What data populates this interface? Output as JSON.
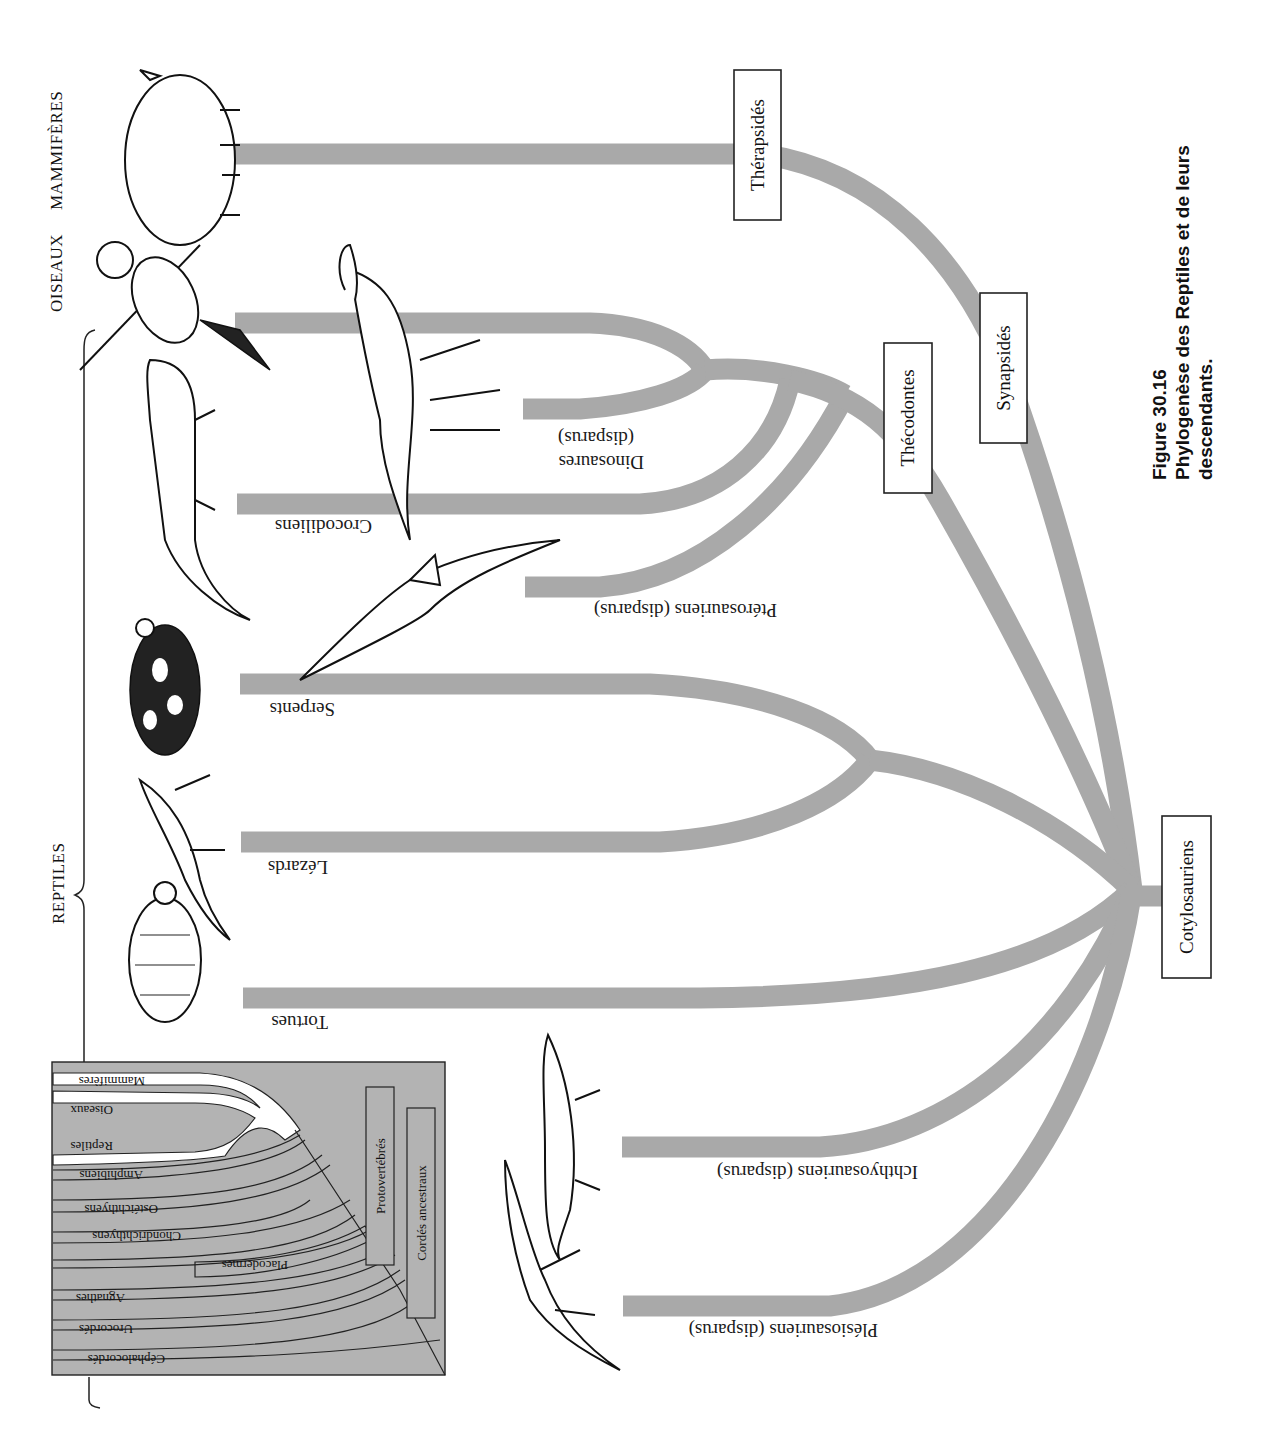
{
  "figure": {
    "number": "Figure 30.16",
    "title_line1": "Phylogenèse des Reptiles et de leurs",
    "title_line2": "descendants."
  },
  "group_labels": {
    "mammiferes": "MAMMIFÈRES",
    "oiseaux": "OISEAUX",
    "reptiles": "REPTILES"
  },
  "nodes": {
    "therapsides": "Thérapsidés",
    "synapsides": "Synapsidés",
    "thecodontes": "Thécodontes",
    "cotylosauriens": "Cotylosauriens"
  },
  "branches": {
    "crocodiliens": "Crocodiliens",
    "dinosaures_1": "Dinosaures",
    "dinosaures_2": "(disparus)",
    "pterosauriens": "Ptérosauriens (disparus)",
    "serpents": "Serpents",
    "lezards": "Lézards",
    "tortues": "Tortues",
    "ichthyosauriens": "Ichthyosauriens (disparus)",
    "plesiosauriens": "Plésiosauriens (disparus)"
  },
  "inset": {
    "bands": [
      "Mammifères",
      "Oiseaux",
      "Reptiles",
      "Amphibiens",
      "Ostéichthyens",
      "Chondrichthyens",
      "Placodermes",
      "Agnathes",
      "Urocordés",
      "Céphalocordés"
    ],
    "protovertebres": "Protovertébrés",
    "cordes_ancestraux": "Cordés ancestraux"
  },
  "colors": {
    "branch": "#a9a9a9",
    "inset_bg": "#b3b3b3",
    "text": "#111111"
  }
}
